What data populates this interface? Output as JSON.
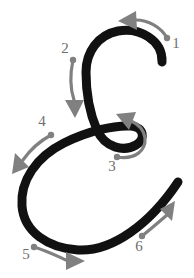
{
  "figure": {
    "width": 194,
    "height": 278,
    "background_color": "#ffffff",
    "glyph": {
      "name": "cursive-e",
      "color": "#111111",
      "stroke_width": 9,
      "description": "Thick black cursive E: upper C-bowl, self-crossing loop, large lower bowl, rising tail"
    },
    "annotation_color": "#808080",
    "label_color": "#6e6e6e"
  },
  "steps": [
    {
      "number": "1",
      "label_x": 176,
      "label_y": 45,
      "dot_x": 167,
      "dot_y": 38,
      "direction": "left",
      "shaft": "M167,38 C161,27 148,20 136,20",
      "head_points": "136,11 118,21 137,30",
      "head_rotate": 0
    },
    {
      "number": "2",
      "label_x": 65,
      "label_y": 50,
      "dot_x": 73,
      "dot_y": 60,
      "direction": "down",
      "shaft": "M73,60 C70,74 70,88 74,100",
      "head_points": "65,100 84,100 75,118",
      "head_rotate": 0
    },
    {
      "number": "3",
      "label_x": 112,
      "label_y": 168,
      "dot_x": 117,
      "dot_y": 157,
      "direction": "up-left",
      "shaft": "M117,157 C136,160 146,150 145,138 C144,130 138,124 131,121",
      "head_points": "136,112 116,114 129,130",
      "head_rotate": 0
    },
    {
      "number": "4",
      "label_x": 42,
      "label_y": 123,
      "dot_x": 51,
      "dot_y": 135,
      "direction": "down-left",
      "shaft": "M51,135 C40,141 30,150 23,160",
      "head_points": "29,167 15,153 12,174",
      "head_rotate": 0
    },
    {
      "number": "5",
      "label_x": 26,
      "label_y": 256,
      "dot_x": 34,
      "dot_y": 247,
      "direction": "right",
      "shaft": "M34,247 C47,251 57,256 66,260",
      "head_points": "66,252 66,270 85,261",
      "head_rotate": 0
    },
    {
      "number": "6",
      "label_x": 139,
      "label_y": 248,
      "dot_x": 142,
      "dot_y": 236,
      "direction": "up-right",
      "shaft": "M142,236 C152,228 160,221 167,215",
      "head_points": "160,209 175,201 172,221",
      "head_rotate": 0
    }
  ],
  "glyph_paths": [
    {
      "name": "glyph-main-path",
      "d": "M162,62 C163,40 139,27 118,31 C98,35 86,52 86,72 C86,94 90,114 97,130 C105,148 124,152 136,145 C146,139 144,127 131,126 C114,125 88,131 64,143 C36,157 20,181 22,206 C24,232 48,248 78,250 C112,252 150,224 178,182"
    }
  ]
}
